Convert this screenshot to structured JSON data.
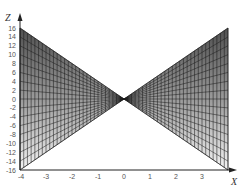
{
  "chart_data": {
    "type": "surface",
    "title": "",
    "xlabel": "X",
    "ylabel": "Z",
    "xlim": [
      -4,
      4
    ],
    "ylim": [
      -16,
      16
    ],
    "x_ticks": [
      -4,
      -3,
      -2,
      -1,
      0,
      1,
      2,
      3
    ],
    "y_ticks": [
      16,
      14,
      12,
      10,
      8,
      6,
      4,
      2,
      0,
      -2,
      -4,
      -6,
      -8,
      -10,
      -12,
      -14,
      -16
    ],
    "x_tick_labels": [
      "-4",
      "-3",
      "-2",
      "-1",
      "0",
      "1",
      "2",
      "3"
    ],
    "y_tick_labels": [
      "16",
      "14",
      "12",
      "10",
      "8",
      "6",
      "4",
      "2",
      "0",
      "-2",
      "-4",
      "-6",
      "-8",
      "-10",
      "-12",
      "-14",
      "-16"
    ],
    "surface": {
      "shape": "bowtie",
      "apex": [
        0,
        0
      ],
      "left_edge": {
        "x": -4,
        "z_top": 16,
        "z_bottom": -16
      },
      "right_edge": {
        "x": 4,
        "z_top": 16,
        "z_bottom": -16
      },
      "shading": "grayscale gradient dark (top) to light (bottom)",
      "mesh": true
    },
    "grid": false,
    "legend": null
  },
  "colors": {
    "dark_fill": "#555555",
    "light_fill": "#f2f2f2",
    "mesh_line": "#1a1a1a",
    "axis": "#222222"
  }
}
